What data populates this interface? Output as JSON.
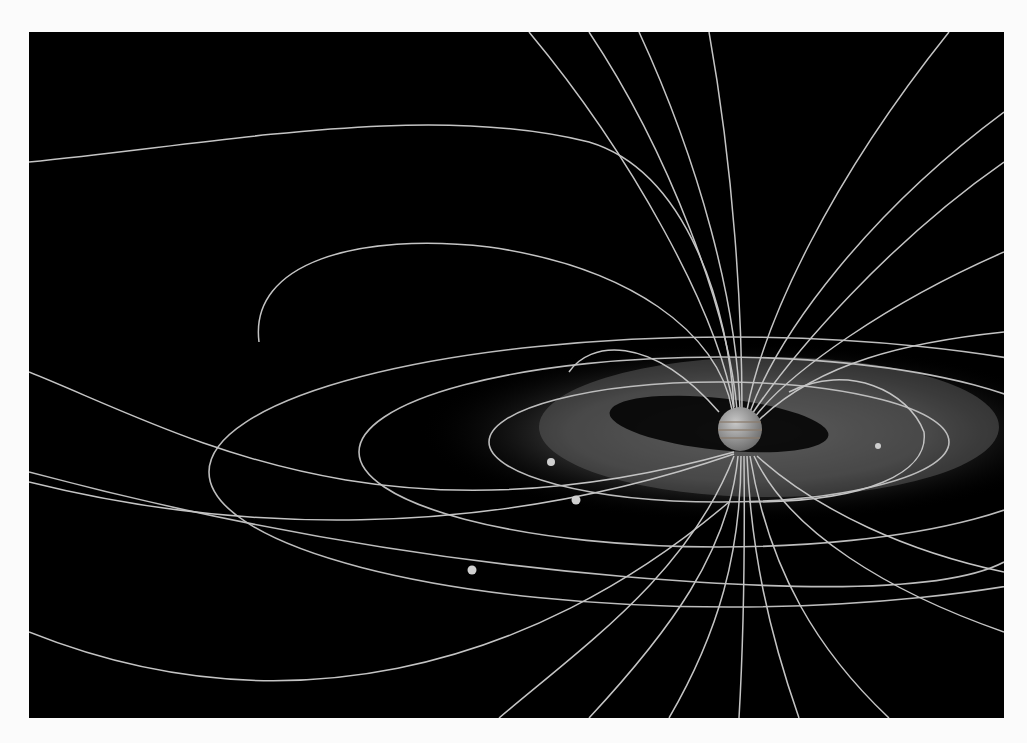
{
  "image": {
    "subject": "Jupiter magnetosphere illustration",
    "background_color": "#000000",
    "frame_color": "#fbfbfb",
    "line_color": "#bdbdbd",
    "planet": {
      "name": "Jupiter",
      "cx": 711,
      "cy": 397,
      "r": 22
    },
    "moons": [
      {
        "name": "moon-1",
        "cx": 522,
        "cy": 430
      },
      {
        "name": "moon-2",
        "cx": 547,
        "cy": 468
      },
      {
        "name": "moon-3",
        "cx": 443,
        "cy": 538
      },
      {
        "name": "moon-4",
        "cx": 849,
        "cy": 414
      }
    ]
  }
}
